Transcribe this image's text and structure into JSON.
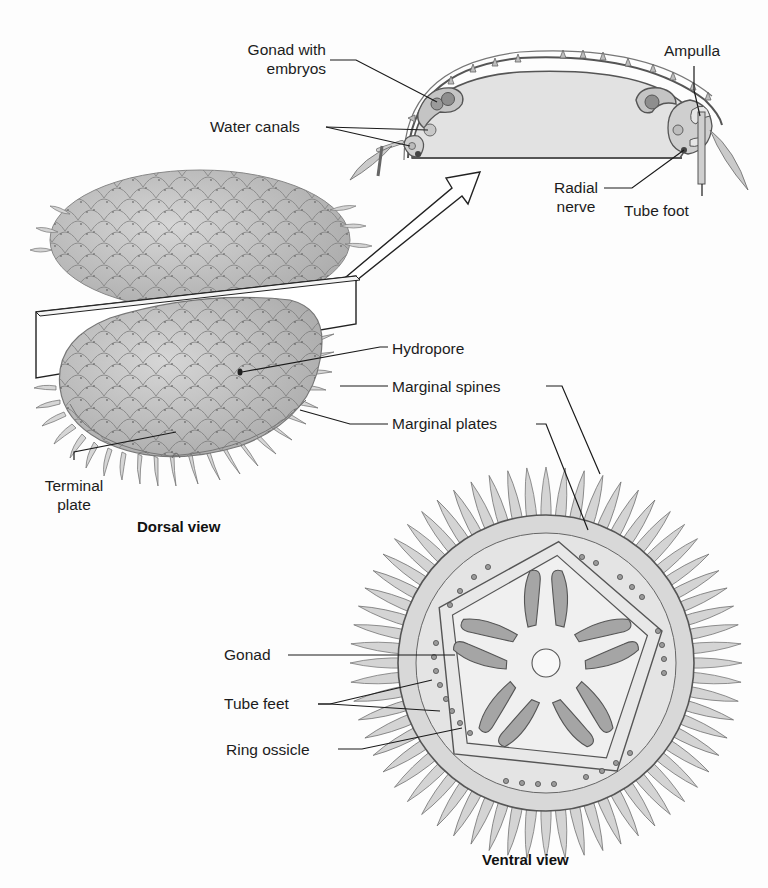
{
  "figure": {
    "views": {
      "cross_section": {
        "labels": {
          "gonad_with_embryos_line1": "Gonad with",
          "gonad_with_embryos_line2": "embryos",
          "water_canals": "Water canals",
          "ampulla": "Ampulla",
          "radial_nerve_line1": "Radial",
          "radial_nerve_line2": "nerve",
          "tube_foot": "Tube foot"
        }
      },
      "dorsal": {
        "caption": "Dorsal view",
        "labels": {
          "hydropore": "Hydropore",
          "marginal_spines": "Marginal spines",
          "marginal_plates": "Marginal plates",
          "terminal_plate_line1": "Terminal",
          "terminal_plate_line2": "plate"
        }
      },
      "ventral": {
        "caption": "Ventral view",
        "labels": {
          "gonad": "Gonad",
          "tube_feet": "Tube feet",
          "ring_ossicle": "Ring ossicle"
        }
      }
    },
    "colors": {
      "background": "#fdfdfd",
      "body_fill": "#c9c9c9",
      "inner_fill": "#e6e6e6",
      "gonad_fill": "#9a9a9a",
      "outline": "#555555",
      "leader": "#1a1a1a"
    }
  }
}
